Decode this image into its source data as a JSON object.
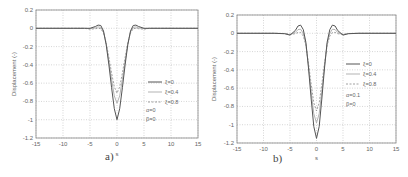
{
  "chart_data": [
    {
      "panel": "a)",
      "type": "line",
      "xlabel": "s",
      "ylabel": "Displacement (-)",
      "xlim": [
        -15,
        15
      ],
      "ylim": [
        -1.2,
        0.2
      ],
      "xticks": [
        "-15",
        "-10",
        "-5",
        "0",
        "5",
        "10",
        "15"
      ],
      "yticks": [
        "0.2",
        "0",
        "-0.2",
        "-0.4",
        "-0.6",
        "-0.8",
        "-1",
        "-1.2"
      ],
      "grid": true,
      "legend_position": "lower right",
      "annotation": [
        "α=0",
        "β=0"
      ],
      "x": [
        -15,
        -8,
        -6,
        -5,
        -4,
        -3.5,
        -3,
        -2.5,
        -2,
        -1.5,
        -1,
        -0.5,
        0,
        0.5,
        1,
        1.5,
        2,
        2.5,
        3,
        3.5,
        4,
        5,
        6,
        8,
        15
      ],
      "series": [
        {
          "name": "ξ=0",
          "style": "solid",
          "values": [
            0,
            0,
            0,
            0.0,
            0.02,
            0.035,
            0.03,
            -0.03,
            -0.18,
            -0.4,
            -0.65,
            -0.88,
            -1.0,
            -0.88,
            -0.65,
            -0.4,
            -0.18,
            -0.03,
            0.03,
            0.035,
            0.02,
            0.0,
            0,
            0,
            0
          ]
        },
        {
          "name": "ξ=0.4",
          "style": "light-solid",
          "values": [
            0,
            0,
            0,
            -0.005,
            0.005,
            0.015,
            0.01,
            -0.04,
            -0.17,
            -0.36,
            -0.56,
            -0.74,
            -0.82,
            -0.74,
            -0.56,
            -0.36,
            -0.17,
            -0.04,
            0.01,
            0.015,
            0.005,
            -0.005,
            0,
            0,
            0
          ]
        },
        {
          "name": "ξ=0.8",
          "style": "dashed",
          "values": [
            0,
            0,
            0,
            -0.01,
            -0.005,
            0.0,
            -0.005,
            -0.05,
            -0.16,
            -0.32,
            -0.49,
            -0.64,
            -0.71,
            -0.64,
            -0.49,
            -0.32,
            -0.16,
            -0.05,
            -0.005,
            0.0,
            -0.005,
            -0.01,
            0,
            0,
            0
          ]
        }
      ]
    },
    {
      "panel": "b)",
      "type": "line",
      "xlabel": "s",
      "ylabel": "Displacement (-)",
      "xlim": [
        -15,
        15
      ],
      "ylim": [
        -1.2,
        0.2
      ],
      "xticks": [
        "-15",
        "-10",
        "-5",
        "0",
        "5",
        "10",
        "15"
      ],
      "yticks": [
        "0.2",
        "0",
        "-0.2",
        "-0.4",
        "-0.6",
        "-0.8",
        "-1",
        "-1.2"
      ],
      "grid": true,
      "legend_position": "right",
      "annotation": [
        "α=0.1",
        "β=0"
      ],
      "x": [
        -15,
        -8,
        -6,
        -5,
        -4,
        -3.5,
        -3,
        -2.5,
        -2,
        -1.5,
        -1,
        -0.5,
        0,
        0.5,
        1,
        1.5,
        2,
        2.5,
        3,
        3.5,
        4,
        5,
        6,
        8,
        15
      ],
      "series": [
        {
          "name": "ξ=0",
          "style": "solid",
          "values": [
            0,
            0,
            -0.005,
            -0.02,
            0.03,
            0.08,
            0.09,
            0.04,
            -0.1,
            -0.38,
            -0.72,
            -1.02,
            -1.15,
            -1.02,
            -0.72,
            -0.38,
            -0.1,
            0.04,
            0.09,
            0.08,
            0.03,
            -0.02,
            -0.005,
            0,
            0
          ]
        },
        {
          "name": "ξ=0.4",
          "style": "light-solid",
          "values": [
            0,
            0,
            -0.003,
            -0.015,
            0.01,
            0.04,
            0.045,
            0.0,
            -0.12,
            -0.36,
            -0.64,
            -0.88,
            -0.98,
            -0.88,
            -0.64,
            -0.36,
            -0.12,
            0.0,
            0.045,
            0.04,
            0.01,
            -0.015,
            -0.003,
            0,
            0
          ]
        },
        {
          "name": "ξ=0.8",
          "style": "dashed",
          "values": [
            0,
            0,
            -0.002,
            -0.012,
            -0.005,
            0.01,
            0.01,
            -0.03,
            -0.13,
            -0.33,
            -0.56,
            -0.76,
            -0.85,
            -0.76,
            -0.56,
            -0.33,
            -0.13,
            -0.03,
            0.01,
            0.01,
            -0.005,
            -0.012,
            -0.002,
            0,
            0
          ]
        }
      ]
    }
  ],
  "panels": [
    {
      "caption": "a)",
      "ylabel": "Displacement (-)",
      "xlabel": "s",
      "legend": [
        "ξ=0",
        "ξ=0.4",
        "ξ=0.8"
      ],
      "annotation_line1": "α=0",
      "annotation_line2": "β=0"
    },
    {
      "caption": "b)",
      "ylabel": "Displacement (-)",
      "xlabel": "s",
      "legend": [
        "ξ=0",
        "ξ=0.4",
        "ξ=0.8"
      ],
      "annotation_line1": "α=0.1",
      "annotation_line2": "β=0"
    }
  ],
  "colors": {
    "axis": "#888888",
    "grid": "#bbbbbb",
    "curve_solid": "#555555",
    "curve_light": "#aaaaaa",
    "curve_dashed": "#888888"
  }
}
